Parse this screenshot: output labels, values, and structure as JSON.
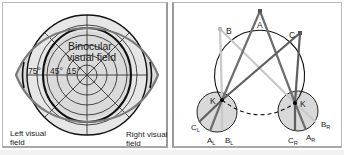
{
  "left_diagram": {
    "title_line1": "Binocular",
    "title_line2": "visual field",
    "degree_labels": [
      "75°",
      "45°",
      "15°"
    ],
    "left_label_line1": "Left visual",
    "left_label_line2": "field",
    "right_label_line1": "Right visual",
    "right_label_line2": "field"
  },
  "right_diagram": {
    "points": {
      "A": "A",
      "B": "B",
      "C": "C",
      "K_left": "K",
      "K_right": "K"
    },
    "retina_labels_left": {
      "C": "C",
      "C_sub": "L",
      "A": "A",
      "A_sub": "L",
      "B": "B",
      "B_sub": "L"
    },
    "retina_labels_right": {
      "C": "C",
      "C_sub": "R",
      "A": "A",
      "A_sub": "R",
      "B": "B",
      "B_sub": "R"
    }
  },
  "colors": {
    "field_fill": "#dedede",
    "lens_stroke": "#7a7a7a",
    "line_dark": "#6e6e6e",
    "line_light": "#c8c8c8",
    "line_black": "#111111"
  }
}
